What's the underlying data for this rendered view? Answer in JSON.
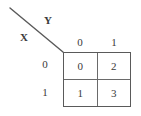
{
  "diagram": {
    "type": "index-matrix",
    "row_variable": "X",
    "col_variable": "Y",
    "column_headers": [
      "0",
      "1"
    ],
    "row_headers": [
      "0",
      "1"
    ],
    "cells": [
      [
        "0",
        "2"
      ],
      [
        "1",
        "3"
      ]
    ],
    "colors": {
      "line": "#5a5a5a",
      "inner_line": "#6a6a6a",
      "text": "#3a3a3a",
      "background": "#ffffff"
    }
  }
}
